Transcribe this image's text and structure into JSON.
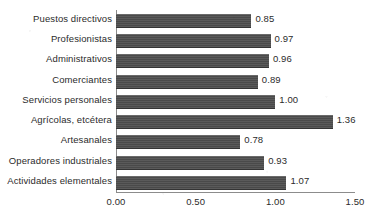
{
  "chart_data": {
    "type": "bar",
    "orientation": "horizontal",
    "title": "",
    "subtitle": "",
    "xlabel": "",
    "ylabel": "",
    "xlim": [
      0,
      1.5
    ],
    "xticks": [
      "0.00",
      "0.50",
      "1.00",
      "1.50"
    ],
    "xtick_values": [
      0,
      0.5,
      1,
      1.5
    ],
    "grid": false,
    "legend": null,
    "bar_color": "#4e4e4e",
    "axis_color": "#8c8c8c",
    "text_color": "#2b2b2b",
    "categories": [
      "Puestos directivos",
      "Profesionistas",
      "Administrativos",
      "Comerciantes",
      "Servicios personales",
      "Agrícolas, etcétera",
      "Artesanales",
      "Operadores industriales",
      "Actividades elementales"
    ],
    "values": [
      0.85,
      0.97,
      0.96,
      0.89,
      1.0,
      1.36,
      0.78,
      0.93,
      1.07
    ],
    "value_labels": [
      "0.85",
      "0.97",
      "0.96",
      "0.89",
      "1.00",
      "1.36",
      "0.78",
      "0.93",
      "1.07"
    ]
  }
}
